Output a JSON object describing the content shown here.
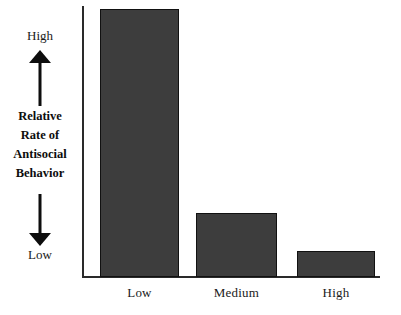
{
  "chart_data": {
    "type": "bar",
    "title": "",
    "subtitle": "",
    "categories": [
      "Low",
      "Medium",
      "High"
    ],
    "values": [
      100,
      24,
      10
    ],
    "series": [
      {
        "name": "Relative Rate of Antisocial Behavior",
        "values": [
          100,
          24,
          10
        ]
      }
    ],
    "xlabel": "",
    "ylabel": "Relative Rate of Antisocial Behavior",
    "ylim": [
      0,
      100
    ],
    "y_axis_low_label": "Low",
    "y_axis_high_label": "High",
    "grid": false,
    "legend": false,
    "bar_color": "#3d3d3d",
    "bar_border_color": "#111111",
    "axis_color": "#2a2a2a",
    "background_color": "#ffffff",
    "annotations": [
      "Upward arrow pointing toward High",
      "Downward arrow pointing toward Low"
    ]
  },
  "y_axis": {
    "high_label": "High",
    "low_label": "Low",
    "title_lines": [
      "Relative",
      "Rate of",
      "Antisocial",
      "Behavior"
    ],
    "up_arrow_icon": "arrow-up-icon",
    "down_arrow_icon": "arrow-down-icon"
  },
  "x_axis": {
    "tick_labels": [
      "Low",
      "Medium",
      "High"
    ]
  },
  "bars": [
    {
      "category": "Low",
      "value": 100,
      "top": 9,
      "height": 268
    },
    {
      "category": "Medium",
      "value": 24,
      "top": 213,
      "height": 64
    },
    {
      "category": "High",
      "value": 10,
      "top": 251,
      "height": 26
    }
  ]
}
